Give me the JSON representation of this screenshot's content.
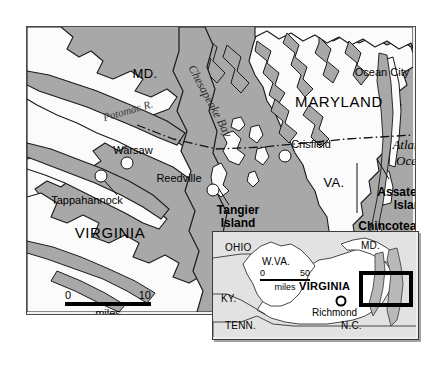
{
  "figure": {
    "type": "map",
    "colors": {
      "water": "#a8a8a8",
      "land": "#fbfbfb",
      "background": "#ffffff",
      "inset_land": "#ffffff",
      "inset_outside": "#e2e2e2",
      "frame": "#4a4a4a",
      "ink": "#000000"
    }
  },
  "main_map": {
    "states": [
      {
        "name": "MD.",
        "x": 118,
        "y": 47
      },
      {
        "name": "MARYLAND",
        "x": 312,
        "y": 75
      },
      {
        "name": "VIRGINIA",
        "x": 83,
        "y": 206
      },
      {
        "name": "VA.",
        "x": 307,
        "y": 156
      }
    ],
    "water_labels": [
      {
        "name": "Potomac R.",
        "x": 101,
        "y": 84,
        "rotation": -16
      },
      {
        "name": "Chesapeake Bay",
        "x": 183,
        "y": 74,
        "rotation": 62
      },
      {
        "name": "Atlantic",
        "x": 386,
        "y": 118
      },
      {
        "name": "Ocean",
        "x": 386,
        "y": 134
      }
    ],
    "cities": [
      {
        "name": "Warsaw",
        "label_x": 106,
        "label_y": 124,
        "dot_x": 100,
        "dot_y": 136,
        "dot_r": 6
      },
      {
        "name": "Tappahannock",
        "label_x": 60,
        "label_y": 174,
        "dot_x": 74,
        "dot_y": 149,
        "dot_r": 6,
        "leader": true
      },
      {
        "name": "Reedville",
        "label_x": 152,
        "label_y": 152,
        "dot_x": 186,
        "dot_y": 163,
        "dot_r": 6
      },
      {
        "name": "Crisfield",
        "label_x": 284,
        "label_y": 118,
        "dot_x": 258,
        "dot_y": 129,
        "dot_r": 6
      },
      {
        "name": "Ocean City",
        "label_x": 355,
        "label_y": 46,
        "dot_x": 398,
        "dot_y": 45,
        "dot_r": 7
      }
    ],
    "island_labels": [
      {
        "name": "Tangier Island",
        "lines": [
          "Tangier",
          "Island"
        ],
        "x": 211,
        "y": 190,
        "leader": true
      },
      {
        "name": "Assateague Island",
        "lines": [
          "Assateague",
          "Island"
        ],
        "x": 384,
        "y": 172,
        "leader": true
      },
      {
        "name": "Chincoteague Island",
        "lines": [
          "Chincoteague",
          "Island"
        ],
        "x": 371,
        "y": 206,
        "leader": true
      }
    ],
    "scale": {
      "min": "0",
      "max": "10",
      "unit": "miles"
    }
  },
  "inset_map": {
    "states": [
      {
        "name": "OHIO",
        "x": 23,
        "y": 17
      },
      {
        "name": "W.VA.",
        "x": 63,
        "y": 31
      },
      {
        "name": "KY.",
        "x": 16,
        "y": 68
      },
      {
        "name": "TENN.",
        "x": 23,
        "y": 95
      },
      {
        "name": "N.C.",
        "x": 139,
        "y": 95
      },
      {
        "name": "MD.",
        "x": 156,
        "y": 15
      },
      {
        "name": "VIRGINIA",
        "x": 110,
        "y": 55
      }
    ],
    "cities": [
      {
        "name": "Richmond",
        "label_x": 116,
        "label_y": 81,
        "dot_x": 128,
        "dot_y": 69
      }
    ],
    "scale": {
      "min": "0",
      "max": "50",
      "unit": "miles"
    },
    "highlight_box": {
      "x": 148,
      "y": 41,
      "w": 50,
      "h": 32
    }
  }
}
